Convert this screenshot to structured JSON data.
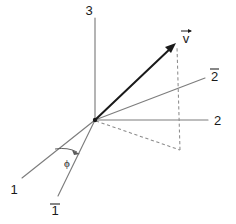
{
  "figure": {
    "background_color": "#ffffff",
    "width": 236,
    "height": 224
  },
  "colors": {
    "axis": "#7d7d7d",
    "vector": "#1a1a1a",
    "dashed": "#8c8c8c",
    "label": "#1a1a1a",
    "background": "#ffffff"
  },
  "origin": {
    "label": "origin",
    "x": 95,
    "y": 120
  },
  "axes": [
    {
      "name": "axis-3",
      "label": "3",
      "has_overbar": false,
      "style": "solid",
      "color": "#7d7d7d",
      "from": [
        95,
        120
      ],
      "to": [
        95,
        18
      ],
      "label_pos": [
        90,
        14
      ]
    },
    {
      "name": "axis-2",
      "label": "2",
      "has_overbar": false,
      "style": "solid",
      "color": "#7d7d7d",
      "from": [
        95,
        120
      ],
      "to": [
        208,
        120
      ],
      "label_pos": [
        213,
        125
      ]
    },
    {
      "name": "axis-2-bar",
      "label": "2",
      "has_overbar": true,
      "style": "solid",
      "color": "#7d7d7d",
      "from": [
        95,
        120
      ],
      "to": [
        205,
        78
      ],
      "label_pos": [
        210,
        80
      ]
    },
    {
      "name": "axis-1",
      "label": "1",
      "has_overbar": false,
      "style": "solid",
      "color": "#7d7d7d",
      "from": [
        95,
        120
      ],
      "to": [
        22,
        178
      ],
      "label_pos": [
        12,
        192
      ]
    },
    {
      "name": "axis-1-bar",
      "label": "1",
      "has_overbar": true,
      "style": "solid",
      "color": "#7d7d7d",
      "from": [
        95,
        120
      ],
      "to": [
        58,
        196
      ],
      "label_pos": [
        52,
        213
      ]
    }
  ],
  "vector": {
    "name": "vector-v",
    "label": "v",
    "has_arrow_accent": true,
    "style": "solid-arrow",
    "color": "#1a1a1a",
    "from": [
      95,
      120
    ],
    "to": [
      175,
      44
    ],
    "label_pos": [
      182,
      40
    ]
  },
  "projections": [
    {
      "name": "projection-in-plane",
      "style": "dashed",
      "from": [
        95,
        120
      ],
      "to": [
        180,
        150
      ]
    },
    {
      "name": "projection-vertical",
      "style": "dashed",
      "from": [
        180,
        150
      ],
      "to": [
        177,
        47
      ]
    }
  ],
  "angle": {
    "name": "angle-phi",
    "symbol": "ϕ",
    "label_pos": [
      67,
      165
    ],
    "arc_start": [
      56,
      150
    ],
    "arc_end": [
      79,
      152
    ],
    "between": [
      "axis-1",
      "axis-1-bar"
    ]
  }
}
